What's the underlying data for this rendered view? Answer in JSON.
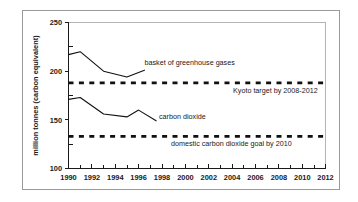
{
  "chart_data": {
    "type": "line",
    "title": "",
    "xlabel": "",
    "ylabel": "million tonnes (carbon equivalent)",
    "xlim": [
      1990,
      2012
    ],
    "ylim": [
      100,
      250
    ],
    "yticks": [
      100,
      150,
      200,
      250
    ],
    "ytick_labels": [
      "100",
      "150",
      "200",
      "250"
    ],
    "xticks": [
      1990,
      1992,
      1994,
      1996,
      1998,
      2000,
      2002,
      2004,
      2006,
      2008,
      2010,
      2012
    ],
    "xtick_labels": [
      "1990",
      "1992",
      "1994",
      "1996",
      "1998",
      "2000",
      "2002",
      "2004",
      "2006",
      "2008",
      "2010",
      "2012"
    ],
    "xtick_minor_step": 1,
    "grid": false,
    "legend_position": "inline-annotations",
    "line_color": "#111111",
    "series": [
      {
        "name": "basket of greenhouse gases",
        "style": "solid",
        "x": [
          1990,
          1991,
          1993,
          1995,
          1996.5
        ],
        "values": [
          217,
          220,
          200,
          194,
          201
        ]
      },
      {
        "name": "carbon dioxide",
        "style": "solid",
        "x": [
          1990,
          1991,
          1993,
          1995,
          1996,
          1997.5
        ],
        "values": [
          171,
          173,
          156,
          153,
          160,
          149
        ]
      },
      {
        "name": "Kyoto target by 2008-2012",
        "style": "dashed",
        "x": [
          1990,
          2012
        ],
        "values": [
          188,
          188
        ]
      },
      {
        "name": "domestic carbon dioxide goal by 2010",
        "style": "dashed",
        "x": [
          1990,
          2012
        ],
        "values": [
          133,
          133
        ]
      }
    ],
    "annotations": [
      {
        "text": "basket of greenhouse gases",
        "x": 1996.8,
        "y": 207
      },
      {
        "text": "Kyoto target by 2008-2012",
        "x": 2003.6,
        "y": 180
      },
      {
        "text": "carbon dioxide",
        "x": 1998.4,
        "y": 152
      },
      {
        "text": "domestic carbon dioxide goal by 2010",
        "x": 2000.6,
        "y": 125
      }
    ]
  },
  "figure": {
    "y_axis_title": "million tonnes (carbon equivalent)",
    "y_tick_250": "250",
    "y_tick_200": "200",
    "y_tick_150": "150",
    "y_tick_100": "100",
    "x_tick_1990": "1990",
    "x_tick_1992": "1992",
    "x_tick_1994": "1994",
    "x_tick_1996": "1996",
    "x_tick_1998": "1998",
    "x_tick_2000": "2000",
    "x_tick_2002": "2002",
    "x_tick_2004": "2004",
    "x_tick_2006": "2006",
    "x_tick_2008": "2008",
    "x_tick_2010": "2010",
    "x_tick_2012": "2012",
    "anno_basket": "basket of greenhouse gases",
    "anno_kyoto": "Kyoto target by 2008-2012",
    "anno_co2": "carbon dioxide",
    "anno_domestic": "domestic carbon dioxide goal by 2010"
  }
}
